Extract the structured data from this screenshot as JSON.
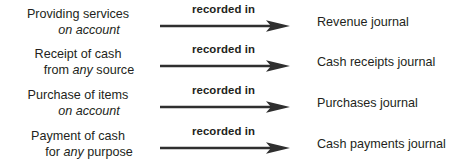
{
  "diagram": {
    "type": "flow-mapping",
    "arrow_color": "#2f2f2f",
    "text_color": "#231f20",
    "background": "#ffffff",
    "rows": [
      {
        "source_line1": "Providing services",
        "source_line2_prefix": "",
        "source_line2_italic": "on account",
        "source_line2_suffix": "",
        "relation": "recorded in",
        "target": "Revenue journal"
      },
      {
        "source_line1": "Receipt of cash",
        "source_line2_prefix": "from ",
        "source_line2_italic": "any",
        "source_line2_suffix": " source",
        "relation": "recorded in",
        "target": "Cash receipts journal"
      },
      {
        "source_line1": "Purchase of items",
        "source_line2_prefix": "",
        "source_line2_italic": "on account",
        "source_line2_suffix": "",
        "relation": "recorded in",
        "target": "Purchases journal"
      },
      {
        "source_line1": "Payment of cash",
        "source_line2_prefix": "for ",
        "source_line2_italic": "any",
        "source_line2_suffix": " purpose",
        "relation": "recorded in",
        "target": "Cash payments journal"
      }
    ]
  }
}
